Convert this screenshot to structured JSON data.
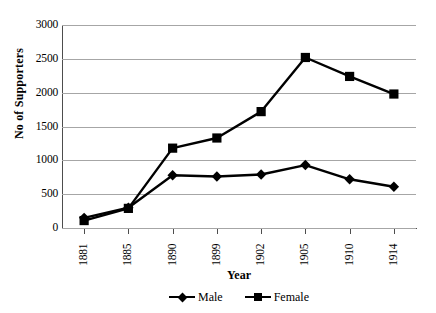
{
  "chart_data": {
    "type": "line",
    "title": "",
    "xlabel": "Year",
    "ylabel": "No of Supporters",
    "categories": [
      "1881",
      "1885",
      "1890",
      "1899",
      "1902",
      "1905",
      "1910",
      "1914"
    ],
    "series": [
      {
        "name": "Male",
        "marker": "diamond",
        "color": "#000000",
        "values": [
          150,
          300,
          780,
          760,
          790,
          930,
          720,
          610
        ]
      },
      {
        "name": "Female",
        "marker": "square",
        "color": "#000000",
        "values": [
          110,
          290,
          1180,
          1330,
          1720,
          2520,
          2240,
          1980
        ]
      }
    ],
    "ylim": [
      0,
      3000
    ],
    "ytick_labels": [
      "3000",
      "2500",
      "2000",
      "1500",
      "1000",
      "500",
      "0"
    ],
    "ytick_values": [
      3000,
      2500,
      2000,
      1500,
      1000,
      500,
      0
    ],
    "grid": true,
    "grid_color": "#a6a6a6",
    "legend_position": "bottom",
    "axis_color": "#4d4d4d",
    "background": "#ffffff"
  }
}
